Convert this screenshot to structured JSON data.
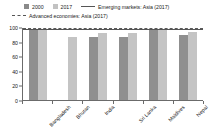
{
  "chart_data": {
    "type": "bar",
    "title": "",
    "xlabel": "",
    "ylabel": "",
    "ylim": [
      0,
      100
    ],
    "grid": false,
    "legend_position": "top",
    "categories": [
      "Bangladesh",
      "Bhutan",
      "India",
      "Sri Lanka",
      "Maldives",
      "Nepal"
    ],
    "series": [
      {
        "name": "2000",
        "values": [
          97,
          0,
          87,
          88,
          99,
          90
        ]
      },
      {
        "name": "2017",
        "values": [
          98,
          88,
          93,
          93,
          99,
          94
        ]
      }
    ],
    "reference_lines": [
      {
        "name": "Emerging markets: Asia (2017)",
        "value": 98,
        "style": "solid"
      },
      {
        "name": "Advanced economies: Asia (2017)",
        "value": 100,
        "style": "dashed"
      }
    ],
    "y_ticks": [
      0,
      20,
      40,
      60,
      80,
      100
    ],
    "y_tick_labels": [
      "0",
      "20",
      "40",
      "60",
      "80",
      "100"
    ]
  },
  "legend": {
    "items": [
      {
        "label": "2000",
        "marker": "square-swatch-dark",
        "color": "#8a8a8a"
      },
      {
        "label": "2017",
        "marker": "square-swatch-light",
        "color": "#c2c2c2"
      },
      {
        "label": "Emerging markets: Asia (2017)",
        "marker": "solid-line",
        "color": "#555555"
      },
      {
        "label": "Advanced economies: Asia (2017)",
        "marker": "dashed-line",
        "color": "#5a5a5a"
      }
    ]
  },
  "colors": {
    "bar_2000": "#8f8f8f",
    "bar_2017": "#c4c4c4",
    "axis": "#6b6b6b",
    "text": "#1a1a1a",
    "background": "#ffffff"
  }
}
